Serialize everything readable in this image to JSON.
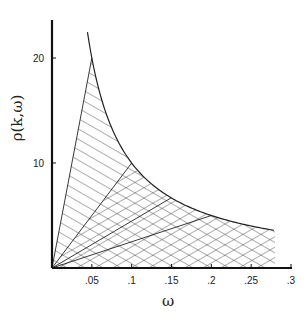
{
  "chart_data": {
    "type": "area",
    "title": "",
    "xlabel": "ω",
    "ylabel": "ρ(k,ω)",
    "xlim": [
      0,
      0.3
    ],
    "ylim": [
      0,
      24
    ],
    "grid": false,
    "x_ticks": [
      ".05",
      ".1",
      ".15",
      ".2",
      ".25",
      ".3"
    ],
    "x_tick_values": [
      0.05,
      0.1,
      0.15,
      0.2,
      0.25,
      0.3
    ],
    "y_ticks": [
      "10",
      "20"
    ],
    "y_tick_values": [
      10,
      20
    ],
    "series": [
      {
        "name": "upper boundary curve ρ ≈ 1/ω",
        "x": [
          0.049,
          0.05,
          0.06,
          0.08,
          0.1,
          0.12,
          0.15,
          0.2,
          0.25,
          0.28
        ],
        "y": [
          22.5,
          20,
          16.7,
          12.5,
          10,
          8.3,
          6.7,
          5,
          4,
          3.6
        ]
      },
      {
        "name": "ray from origin to (0.05, 20)",
        "x": [
          0,
          0.05
        ],
        "y": [
          0,
          20
        ]
      },
      {
        "name": "ray from origin to (0.1, 10)",
        "x": [
          0,
          0.1
        ],
        "y": [
          0,
          10
        ]
      },
      {
        "name": "ray from origin to (0.15, 6.7)",
        "x": [
          0,
          0.15
        ],
        "y": [
          0,
          6.7
        ]
      },
      {
        "name": "ray from origin to (0.2, 5)",
        "x": [
          0,
          0.2
        ],
        "y": [
          0,
          5
        ]
      }
    ],
    "regions": [
      {
        "name": "single-hatched region",
        "between": [
          "ray to (0.05,20)",
          "ray to (0.1,10)"
        ],
        "hatch": "single diagonal"
      },
      {
        "name": "cross-hatched region",
        "between": [
          "x-axis",
          "ray to (0.1,10)"
        ],
        "x_range": [
          0,
          0.28
        ],
        "hatch": "cross diagonal"
      }
    ]
  }
}
